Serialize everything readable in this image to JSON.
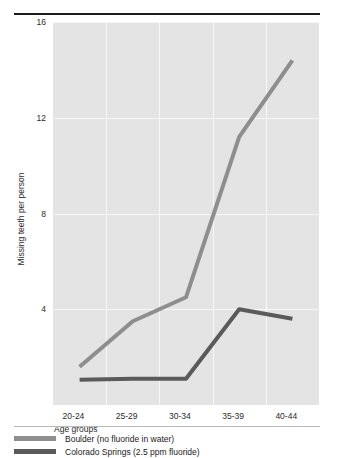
{
  "top_caption_remnant": "",
  "chart_data": {
    "type": "line",
    "title": "",
    "xlabel": "Age groups",
    "ylabel": "Missing teeth per person",
    "categories": [
      "20-24",
      "25-29",
      "30-34",
      "35-39",
      "40-44"
    ],
    "ylim": [
      0,
      16
    ],
    "yticks": [
      16,
      12,
      8,
      4
    ],
    "grid": true,
    "legend_position": "bottom",
    "series": [
      {
        "name": "Boulder (no fluoride in water)",
        "color": "#8e8e8e",
        "values": [
          1.6,
          3.5,
          4.5,
          11.2,
          14.4
        ]
      },
      {
        "name": "Colorado Springs (2.5 ppm fluoride)",
        "color": "#5a5a5a",
        "values": [
          1.05,
          1.1,
          1.1,
          4.0,
          3.6
        ]
      }
    ]
  },
  "legend": {
    "items": [
      {
        "label": "Boulder (no fluoride in water)",
        "color": "#8e8e8e"
      },
      {
        "label": "Colorado Springs (2.5 ppm fluoride)",
        "color": "#5a5a5a"
      }
    ]
  }
}
